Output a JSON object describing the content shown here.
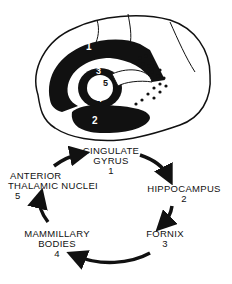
{
  "brain": {
    "regions": [
      {
        "num": "1",
        "name": "cingulate gyrus"
      },
      {
        "num": "2",
        "name": "hippocampus"
      },
      {
        "num": "3",
        "name": "fornix"
      },
      {
        "num": "4",
        "name": "mammillary bodies"
      },
      {
        "num": "5",
        "name": "anterior thalamic nuclei"
      }
    ]
  },
  "circuit": {
    "nodes": [
      {
        "line1": "CINGULATE",
        "line2": "GYRUS",
        "num": "1"
      },
      {
        "line1": "HIPPOCAMPUS",
        "line2": "",
        "num": "2"
      },
      {
        "line1": "FORNIX",
        "line2": "",
        "num": "3"
      },
      {
        "line1": "MAMMILLARY",
        "line2": "BODIES",
        "num": "4"
      },
      {
        "line1": "ANTERIOR",
        "line2": "THALAMIC NUCLEI",
        "num": "5"
      }
    ]
  },
  "colors": {
    "ink": "#111111",
    "paper": "#ffffff"
  }
}
